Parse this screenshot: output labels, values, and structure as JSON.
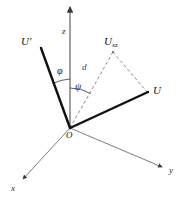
{
  "figure": {
    "type": "vector-diagram",
    "background_color": "#ffffff",
    "width": 182,
    "height": 197
  },
  "colors": {
    "axis": "#6e6e6e",
    "vector": "#111111",
    "dashed": "#8c8c8c",
    "arc": "#4a4a4a",
    "label": "#1a1a1a"
  },
  "axes": {
    "z": {
      "label": "z",
      "origin": [
        70,
        128
      ],
      "tip": [
        70,
        5
      ],
      "arrow": true,
      "style": "solid"
    },
    "x": {
      "label": "x",
      "origin": [
        70,
        128
      ],
      "tip": [
        21,
        181
      ],
      "arrow": true,
      "style": "solid"
    },
    "y": {
      "label": "y",
      "origin": [
        70,
        128
      ],
      "tip": [
        164,
        168
      ],
      "arrow": true,
      "style": "solid"
    }
  },
  "origin": {
    "label": "O",
    "point": [
      70,
      128
    ]
  },
  "vectors": [
    {
      "name": "U-prime",
      "label": "U",
      "label_prime": "′",
      "from": [
        70,
        128
      ],
      "to": [
        41,
        48
      ],
      "style": "thick-solid"
    },
    {
      "name": "U",
      "label": "U",
      "from": [
        70,
        128
      ],
      "to": [
        148,
        92
      ],
      "style": "thick-solid"
    }
  ],
  "projection": {
    "name": "U-xz",
    "label": "U",
    "subscript": "xz",
    "point": [
      113,
      51
    ],
    "from": [
      70,
      128
    ],
    "style": "dashed"
  },
  "dashed_segments": [
    {
      "name": "origin-to-Uxz",
      "from": [
        70,
        128
      ],
      "to": [
        113,
        51
      ]
    },
    {
      "name": "Uxz-to-U",
      "from": [
        113,
        51
      ],
      "to": [
        148,
        92
      ]
    }
  ],
  "distance": {
    "label": "d",
    "position": [
      84,
      69
    ],
    "along": "origin-to-Uxz"
  },
  "angles": [
    {
      "name": "phi",
      "label": "φ",
      "between": [
        "U-prime",
        "z-axis"
      ],
      "vertex": [
        70,
        128
      ],
      "radius": 48,
      "position": [
        60,
        68
      ]
    },
    {
      "name": "psi",
      "label": "ψ",
      "between": [
        "z-axis",
        "origin-to-Uxz"
      ],
      "vertex": [
        70,
        128
      ],
      "radius": 40,
      "position": [
        77,
        84
      ]
    }
  ],
  "labels": {
    "z_axis": "z",
    "x_axis": "x",
    "y_axis": "y",
    "origin": "O",
    "u_prime": "U",
    "u_prime_mark": "′",
    "u_vector": "U",
    "u_projection": "U",
    "u_projection_sub": "xz",
    "distance": "d",
    "angle_phi": "φ",
    "angle_psi": "ψ"
  }
}
